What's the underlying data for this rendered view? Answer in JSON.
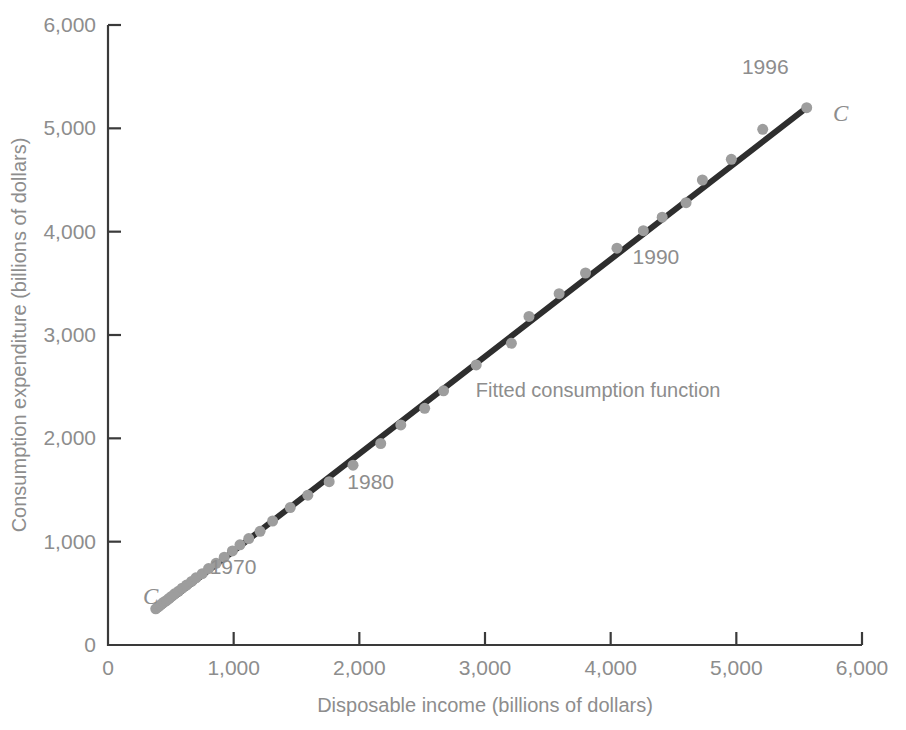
{
  "chart_data": {
    "type": "scatter",
    "title": "",
    "xlabel": "Disposable income (billions of dollars)",
    "ylabel": "Consumption expenditure (billions of dollars)",
    "xlim": [
      0,
      6000
    ],
    "ylim": [
      0,
      6000
    ],
    "xticks": [
      0,
      1000,
      2000,
      3000,
      4000,
      5000,
      6000
    ],
    "yticks": [
      0,
      1000,
      2000,
      3000,
      4000,
      5000,
      6000
    ],
    "xticklabels": [
      "0",
      "1,000",
      "2,000",
      "3,000",
      "4,000",
      "5,000",
      "6,000"
    ],
    "yticklabels": [
      "0",
      "1,000",
      "2,000",
      "3,000",
      "4,000",
      "5,000",
      "6,000"
    ],
    "grid": false,
    "legend_position": "none",
    "point_color": "#9d9d9d",
    "line_color": "#2e2e2e",
    "axis_color": "#3a3a3a",
    "text_color": "#8d8d8d",
    "series": [
      {
        "name": "Disposable income vs consumption expenditure",
        "x": [
          380,
          400,
          415,
          430,
          445,
          465,
          485,
          505,
          530,
          560,
          590,
          625,
          665,
          700,
          750,
          800,
          860,
          925,
          990,
          1050,
          1120,
          1210,
          1310,
          1450,
          1590,
          1760,
          1950,
          2170,
          2330,
          2520,
          2670,
          2930,
          3210,
          3350,
          3590,
          3800,
          4050,
          4260,
          4410,
          4600,
          4730,
          4960,
          5210,
          5560
        ],
        "y": [
          350,
          370,
          385,
          400,
          415,
          430,
          450,
          470,
          495,
          520,
          550,
          580,
          615,
          650,
          690,
          740,
          790,
          850,
          910,
          970,
          1030,
          1100,
          1200,
          1330,
          1450,
          1580,
          1740,
          1950,
          2130,
          2290,
          2460,
          2710,
          2920,
          3180,
          3400,
          3600,
          3840,
          4010,
          4140,
          4280,
          4500,
          4700,
          4990,
          5200
        ]
      }
    ],
    "fit_line": {
      "name": "Fitted consumption function",
      "x_start": 400,
      "y_start": 345,
      "x_end": 5560,
      "y_end": 5200
    },
    "annotations": [
      {
        "text": "1970",
        "x": 995,
        "y": 690,
        "name": "year-label-1970"
      },
      {
        "text": "1980",
        "x": 2090,
        "y": 1505,
        "name": "year-label-1980"
      },
      {
        "text": "1990",
        "x": 4360,
        "y": 3690,
        "name": "year-label-1990"
      },
      {
        "text": "1996",
        "x": 5230,
        "y": 5530,
        "name": "year-label-1996"
      },
      {
        "text": "Fitted consumption function",
        "x": 3900,
        "y": 2400,
        "name": "fitted-function-label"
      },
      {
        "text": "C",
        "x": 340,
        "y": 400,
        "name": "curve-label-c-lower"
      },
      {
        "text": "C",
        "x": 5830,
        "y": 5070,
        "name": "curve-label-c-upper"
      }
    ]
  }
}
